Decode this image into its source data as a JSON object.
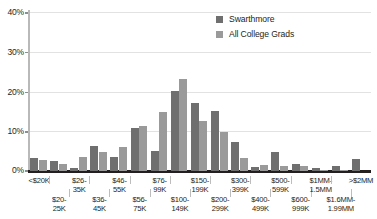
{
  "chart_data": {
    "type": "bar",
    "title": "",
    "subtitle": "",
    "xlabel": "",
    "ylabel": "",
    "ylim": [
      0,
      40
    ],
    "y_ticks": [
      "0%",
      "10%",
      "20%",
      "30%",
      "40%"
    ],
    "y_tick_values": [
      0,
      10,
      20,
      30,
      40
    ],
    "grid": "horizontal",
    "legend_position": "top-right",
    "categories": [
      "<$20K",
      "$20-25K",
      "$26-35K",
      "$36-45K",
      "$46-55K",
      "$56-75K",
      "$76-99K",
      "$100-149K",
      "$150-199K",
      "$200-299K",
      "$300-399K",
      "$400-499K",
      "$500-599K",
      "$600-999K",
      "$1MM-1.5MM",
      "$1.6MM-1.99MM",
      ">$2MM"
    ],
    "category_label_lines": [
      [
        "<$20K",
        ""
      ],
      [
        "$20-",
        "25K"
      ],
      [
        "$26-",
        "35K"
      ],
      [
        "$36-",
        "45K"
      ],
      [
        "$46-",
        "55K"
      ],
      [
        "$56-",
        "75K"
      ],
      [
        "$76-",
        "99K"
      ],
      [
        "$100-",
        "149K"
      ],
      [
        "$150-",
        "199K"
      ],
      [
        "$200-",
        "299K"
      ],
      [
        "$300-",
        "399K"
      ],
      [
        "$400-",
        "499K"
      ],
      [
        "$500-",
        "599K"
      ],
      [
        "$600-",
        "999K"
      ],
      [
        "$1MM-",
        "1.5MM"
      ],
      [
        "$1.6MM-",
        "1.99MM"
      ],
      [
        ">$2MM",
        ""
      ]
    ],
    "series": [
      {
        "name": "Swarthmore",
        "color": "#6f6f6f",
        "values": [
          3.2,
          2.6,
          0.7,
          6.3,
          3.5,
          10.7,
          5.1,
          20.1,
          17.2,
          15.2,
          7.4,
          1.0,
          4.8,
          1.8,
          0.7,
          1.2,
          2.9
        ]
      },
      {
        "name": "All College Grads",
        "color": "#9a9a9a",
        "values": [
          2.8,
          1.8,
          3.6,
          4.9,
          6.1,
          11.2,
          14.8,
          23.1,
          12.6,
          9.8,
          3.3,
          1.5,
          1.3,
          1.3,
          0.3,
          0.2,
          0.0
        ]
      }
    ]
  },
  "legend": {
    "items": [
      {
        "label": "Swarthmore"
      },
      {
        "label": "All College Grads"
      }
    ]
  }
}
